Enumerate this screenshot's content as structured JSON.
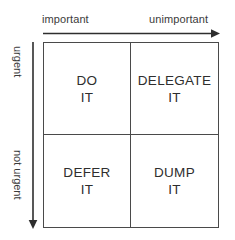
{
  "diagram": {
    "background_color": "#ffffff",
    "line_color": "#4a4a4a",
    "text_color": "#2e2e2e",
    "axis_label_color": "#3b3b3b"
  },
  "axes": {
    "x": {
      "left_label": "important",
      "right_label": "unimportant",
      "direction": "right",
      "arrow_icon": "arrow-right-icon"
    },
    "y": {
      "top_label": "urgent",
      "bottom_label": "not urgent",
      "direction": "down",
      "arrow_icon": "arrow-down-icon"
    }
  },
  "quadrants": [
    {
      "key": "do",
      "line1": "DO",
      "line2": "IT",
      "row": "urgent",
      "column": "important"
    },
    {
      "key": "delegate",
      "line1": "DELEGATE",
      "line2": "IT",
      "row": "urgent",
      "column": "unimportant"
    },
    {
      "key": "defer",
      "line1": "DEFER",
      "line2": "IT",
      "row": "not urgent",
      "column": "important"
    },
    {
      "key": "dump",
      "line1": "DUMP",
      "line2": "IT",
      "row": "not urgent",
      "column": "unimportant"
    }
  ]
}
